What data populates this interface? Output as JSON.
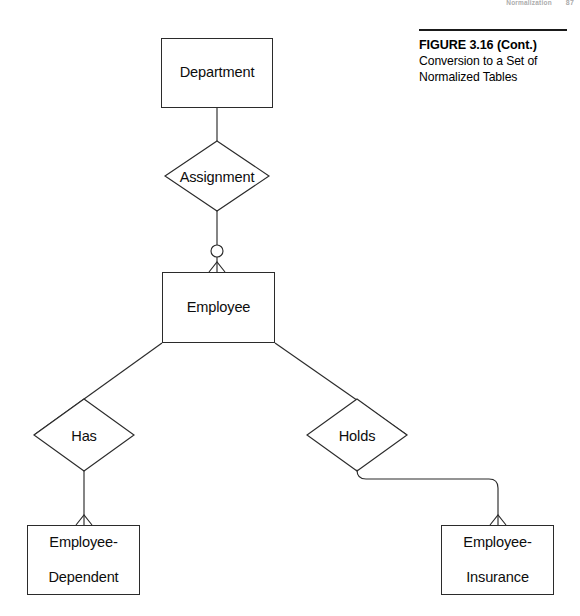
{
  "page": {
    "width": 580,
    "height": 616,
    "background": "#ffffff",
    "line_color": "#2b2b2b",
    "text_color": "#0d0d0d"
  },
  "running_head": {
    "section": "Normalization",
    "page_number": "87"
  },
  "caption": {
    "title": "FIGURE 3.16 (Cont.)",
    "subtitle": "Conversion to a Set of\nNormalized Tables",
    "subtitle_line1": "Conversion to a Set of",
    "subtitle_line2": "Normalized Tables"
  },
  "diagram": {
    "type": "entity-relationship-diagram",
    "notation": "crows-foot",
    "entities": [
      {
        "id": "department",
        "label": "Department",
        "shape": "rectangle",
        "x": 161,
        "y": 38,
        "w": 112,
        "h": 70
      },
      {
        "id": "employee",
        "label": "Employee",
        "shape": "rectangle",
        "x": 162,
        "y": 272,
        "w": 113,
        "h": 71
      },
      {
        "id": "employee-dependent",
        "label": "Employee-\nDependent",
        "label_line1": "Employee-",
        "label_line2": "Dependent",
        "shape": "rectangle",
        "x": 27,
        "y": 525,
        "w": 113,
        "h": 70
      },
      {
        "id": "employee-insurance",
        "label": "Employee-\nInsurance",
        "label_line1": "Employee-",
        "label_line2": "Insurance",
        "shape": "rectangle",
        "x": 441,
        "y": 525,
        "w": 113,
        "h": 70
      }
    ],
    "relationships": [
      {
        "id": "assignment",
        "label": "Assignment",
        "shape": "diamond",
        "cx": 217,
        "cy": 176,
        "rx": 52,
        "ry": 35,
        "from": "department",
        "to": "employee"
      },
      {
        "id": "has",
        "label": "Has",
        "shape": "diamond",
        "cx": 84,
        "cy": 435,
        "rx": 50,
        "ry": 36,
        "from": "employee",
        "to": "employee-dependent"
      },
      {
        "id": "holds",
        "label": "Holds",
        "shape": "diamond",
        "cx": 357,
        "cy": 435,
        "rx": 50,
        "ry": 36,
        "from": "employee",
        "to": "employee-insurance"
      }
    ],
    "connectors": [
      {
        "id": "department-assignment",
        "from": "department",
        "to": "assignment",
        "style": "straight",
        "cardinality_from": "one",
        "cardinality_to": "one"
      },
      {
        "id": "assignment-employee",
        "from": "assignment",
        "to": "employee",
        "style": "straight",
        "markers": [
          "optional-circle",
          "crows-foot"
        ]
      },
      {
        "id": "employee-has",
        "from": "employee",
        "to": "has",
        "style": "diagonal"
      },
      {
        "id": "employee-holds",
        "from": "employee",
        "to": "holds",
        "style": "diagonal"
      },
      {
        "id": "has-employee-dependent",
        "from": "has",
        "to": "employee-dependent",
        "style": "straight",
        "markers": [
          "crows-foot"
        ]
      },
      {
        "id": "holds-employee-insurance",
        "from": "holds",
        "to": "employee-insurance",
        "style": "elbow-rounded",
        "markers": [
          "crows-foot"
        ]
      }
    ]
  }
}
